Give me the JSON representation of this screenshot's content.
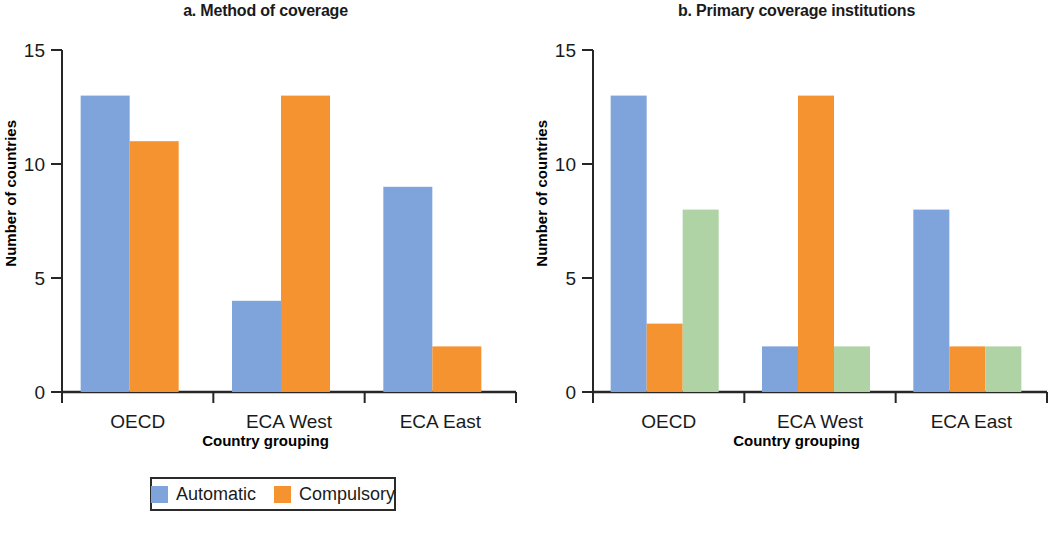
{
  "figure": {
    "panels": [
      {
        "id": "a",
        "title": "a. Method of coverage",
        "xlabel": "Country grouping",
        "ylabel": "Number of countries"
      },
      {
        "id": "b",
        "title": "b. Primary coverage institutions",
        "xlabel": "Country grouping",
        "ylabel": "Number of countries"
      }
    ]
  },
  "colors": {
    "blue": "#7FA3DB",
    "orange": "#F4932F",
    "green": "#AFD3A4",
    "axis": "#262626",
    "text": "#1a1a1a",
    "background": "#ffffff"
  },
  "chart_data": [
    {
      "type": "bar",
      "panel": "a",
      "title": "a. Method of coverage",
      "xlabel": "Country grouping",
      "ylabel": "Number of countries",
      "categories": [
        "OECD",
        "ECA West",
        "ECA East"
      ],
      "ylim": [
        0,
        15
      ],
      "yticks": [
        0,
        5,
        10,
        15
      ],
      "ytick_labels": [
        "0",
        "5",
        "10",
        "15"
      ],
      "grid": false,
      "legend_position": "bottom",
      "series": [
        {
          "name": "Automatic",
          "color": "#7FA3DB",
          "values": [
            13,
            4,
            9
          ]
        },
        {
          "name": "Compulsory",
          "color": "#F4932F",
          "values": [
            11,
            13,
            2
          ]
        }
      ]
    },
    {
      "type": "bar",
      "panel": "b",
      "title": "b. Primary coverage institutions",
      "xlabel": "Country grouping",
      "ylabel": "Number of countries",
      "categories": [
        "OECD",
        "ECA West",
        "ECA East"
      ],
      "ylim": [
        0,
        15
      ],
      "yticks": [
        0,
        5,
        10,
        15
      ],
      "ytick_labels": [
        "0",
        "5",
        "10",
        "15"
      ],
      "grid": false,
      "legend_position": "bottom",
      "series": [
        {
          "name": "National or local services",
          "color": "#7FA3DB",
          "values": [
            13,
            2,
            8
          ]
        },
        {
          "name": "Common insurance",
          "color": "#F4932F",
          "values": [
            3,
            13,
            2
          ]
        },
        {
          "name": "Multiple insurers",
          "color": "#AFD3A4",
          "values": [
            8,
            2,
            2
          ]
        }
      ]
    }
  ]
}
